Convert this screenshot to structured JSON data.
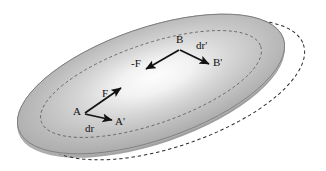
{
  "figure": {
    "background_color": "#ffffff",
    "disk": {
      "name": "rigid-body-disk",
      "fill_light": "#fbfbfb",
      "fill_mid": "#b9b9b9",
      "fill_dark": "#9a9a9a",
      "rim_color": "#6e6e6e",
      "center_x": 151,
      "center_y": 84,
      "rx": 140,
      "ry": 56,
      "rotation_deg": -19
    },
    "inner_dashed_ellipse": {
      "name": "inner-dashed-ellipse",
      "rx": 116,
      "ry": 40,
      "color": "#5a5a5a"
    },
    "displaced_outline": {
      "name": "displaced-dashed-outline",
      "center_x": 171,
      "center_y": 90,
      "rx": 140,
      "ry": 56,
      "rotation_deg": -19,
      "color": "#2b2b2b"
    },
    "arrow_color": "#121212"
  },
  "vectors": [
    {
      "id": "force-F-at-A",
      "label": "F",
      "label_x": 102,
      "label_y": 88,
      "x1": 85,
      "y1": 113,
      "x2": 121,
      "y2": 88
    },
    {
      "id": "displacement-dr-at-A",
      "label": "dr",
      "label_x": 85,
      "label_y": 123,
      "x1": 85,
      "y1": 114,
      "x2": 112,
      "y2": 120
    },
    {
      "id": "force-minus-F-at-B",
      "label": "-F",
      "label_x": 131,
      "label_y": 58,
      "x1": 179,
      "y1": 50,
      "x2": 146,
      "y2": 69
    },
    {
      "id": "displacement-dr-prime-at-B",
      "label": "dr'",
      "label_x": 196,
      "label_y": 40,
      "x1": 180,
      "y1": 50,
      "x2": 209,
      "y2": 64
    }
  ],
  "points": [
    {
      "id": "point-A",
      "label": "A",
      "x": 73,
      "y": 106
    },
    {
      "id": "point-A-prime",
      "label": "A'",
      "x": 115,
      "y": 116
    },
    {
      "id": "point-B",
      "label": "B",
      "x": 176,
      "y": 34
    },
    {
      "id": "point-B-prime",
      "label": "B'",
      "x": 213,
      "y": 57
    }
  ]
}
